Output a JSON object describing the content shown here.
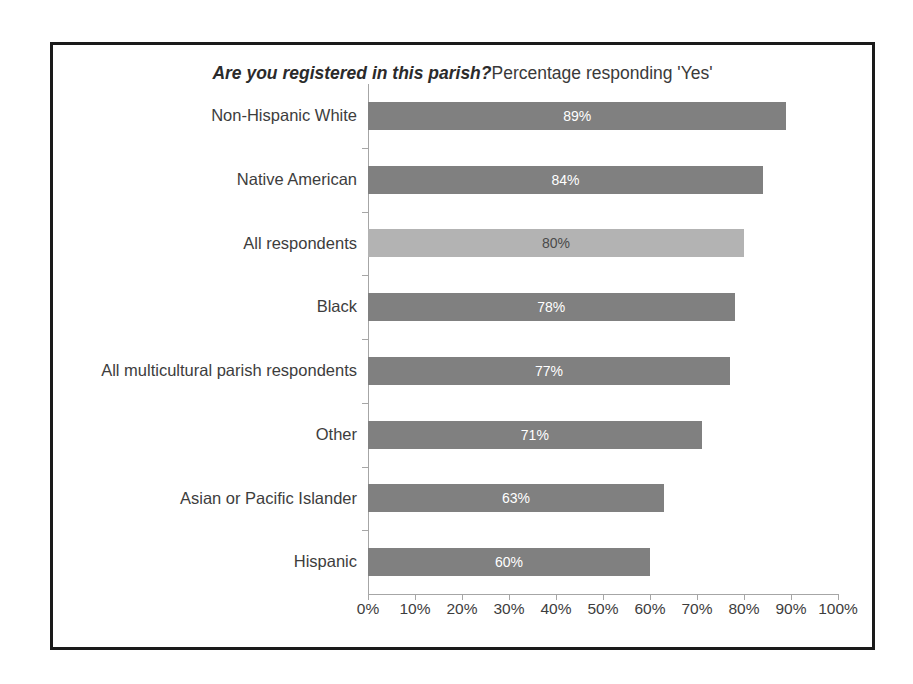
{
  "chart_data": {
    "type": "bar",
    "orientation": "horizontal",
    "title_emphasis": "Are you registered in this parish?",
    "title_rest": "Percentage responding 'Yes'",
    "xlabel": "",
    "ylabel": "",
    "xlim": [
      0,
      100
    ],
    "xticks": [
      0,
      10,
      20,
      30,
      40,
      50,
      60,
      70,
      80,
      90,
      100
    ],
    "xtick_labels": [
      "0%",
      "10%",
      "20%",
      "30%",
      "40%",
      "50%",
      "60%",
      "70%",
      "80%",
      "90%",
      "100%"
    ],
    "grid": false,
    "legend": false,
    "value_suffix": "%",
    "categories": [
      "Non-Hispanic White",
      "Native American",
      "All respondents",
      "Black",
      "All multicultural parish respondents",
      "Other",
      "Asian or Pacific Islander",
      "Hispanic"
    ],
    "values": [
      89,
      84,
      80,
      78,
      77,
      71,
      63,
      60
    ],
    "value_labels": [
      "89%",
      "84%",
      "80%",
      "78%",
      "77%",
      "71%",
      "63%",
      "60%"
    ],
    "highlight_index": 2,
    "colors": {
      "bar": "#808080",
      "bar_highlight": "#b3b3b3",
      "bar_label": "#ffffff",
      "bar_label_highlight": "#4a4a4a",
      "axis": "#a6a6a6",
      "text": "#3d3d3d",
      "frame": "#1a1a1a",
      "background": "#ffffff"
    }
  }
}
